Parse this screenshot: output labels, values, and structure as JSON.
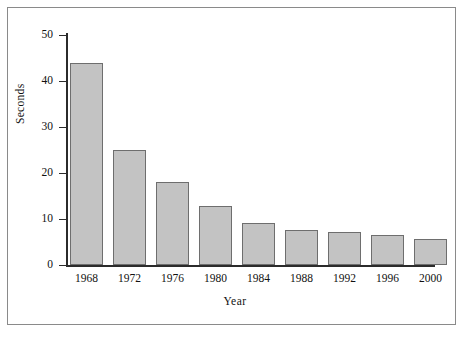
{
  "chart_data": {
    "type": "bar",
    "title": "",
    "subtitle": "",
    "xlabel": "Year",
    "ylabel": "Seconds",
    "categories": [
      "1968",
      "1972",
      "1976",
      "1980",
      "1984",
      "1988",
      "1992",
      "1996",
      "2000"
    ],
    "values": [
      44,
      25,
      18,
      12.8,
      9.2,
      7.7,
      7.1,
      6.5,
      5.6
    ],
    "ylim": [
      0,
      50
    ],
    "y_ticks": [
      0,
      10,
      20,
      30,
      40,
      50
    ],
    "y_tick_labels": [
      "0",
      "10",
      "20",
      "30",
      "40",
      "50"
    ],
    "grid": false,
    "legend": null,
    "legend_position": "none",
    "annotations": [],
    "series": [
      {
        "name": "Seconds",
        "values": [
          44,
          25,
          18,
          12.8,
          9.2,
          7.7,
          7.1,
          6.5,
          5.6
        ]
      }
    ],
    "colors": {
      "bar_fill": "#c3c3c3",
      "bar_stroke": "#6e6e6e",
      "axis": "#2b2b2b",
      "text": "#111111",
      "frame": "#8a8a8a",
      "background": "#ffffff"
    }
  }
}
